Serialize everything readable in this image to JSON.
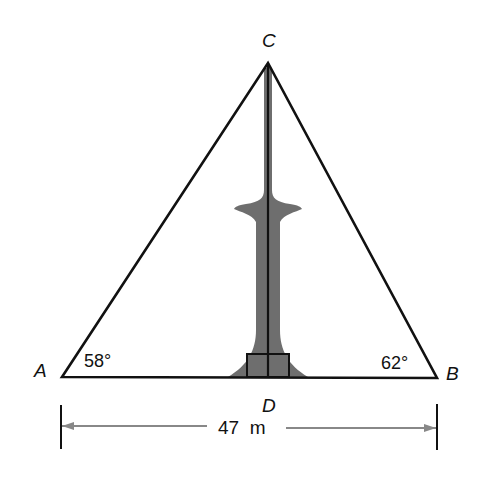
{
  "diagram": {
    "type": "triangle-height-problem",
    "points": {
      "A": {
        "label": "A",
        "x": 62,
        "y": 377
      },
      "B": {
        "label": "B",
        "x": 437,
        "y": 378
      },
      "C": {
        "label": "C",
        "x": 268,
        "y": 63
      },
      "D": {
        "label": "D",
        "x": 268,
        "y": 377
      }
    },
    "angles": {
      "A": "58°",
      "B": "62°"
    },
    "dimension": {
      "value": "47",
      "unit": "m",
      "label": "47  m"
    },
    "object": "tower",
    "colors": {
      "line": "#111111",
      "tower": "#6e6e6e",
      "arrow": "#888888",
      "background": "#ffffff"
    }
  }
}
